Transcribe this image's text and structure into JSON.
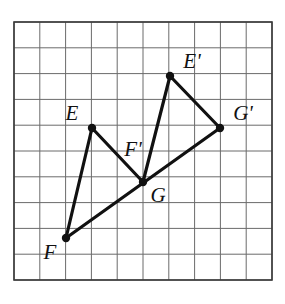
{
  "figure": {
    "background_color": "#ffffff",
    "grid": {
      "columns": 10,
      "rows": 10,
      "cell_size": 25.8,
      "origin_x": 14,
      "origin_y": 22,
      "line_color": "#6b6b6b",
      "border_color": "#3a3a3a",
      "line_width": 1,
      "border_width": 1.6
    },
    "shape_style": {
      "stroke_color": "#111111",
      "stroke_width": 3.2,
      "vertex_dot_color": "#111111",
      "vertex_dot_radius": 4.2
    },
    "label_font_size": 21
  },
  "points": [
    {
      "id": "E",
      "label": "E",
      "x": 92,
      "y": 128,
      "grid_col": 3,
      "grid_row": 4,
      "label_x": 72,
      "label_y": 120,
      "label_anchor": "middle"
    },
    {
      "id": "F",
      "label": "F",
      "x": 66,
      "y": 238,
      "grid_col": 2,
      "grid_row": 8.4,
      "label_x": 50,
      "label_y": 259,
      "label_anchor": "middle"
    },
    {
      "id": "G",
      "label": "G",
      "x": 143,
      "y": 182,
      "grid_col": 5,
      "grid_row": 6.2,
      "label_x": 158,
      "label_y": 202,
      "label_anchor": "middle"
    },
    {
      "id": "Ep",
      "label": "E'",
      "x": 170,
      "y": 76,
      "grid_col": 6,
      "grid_row": 2.1,
      "label_x": 192,
      "label_y": 68,
      "label_anchor": "middle"
    },
    {
      "id": "Fp",
      "label": "F'",
      "x": 143,
      "y": 182,
      "grid_col": 5,
      "grid_row": 6.2,
      "label_x": 133,
      "label_y": 156,
      "label_anchor": "middle"
    },
    {
      "id": "Gp",
      "label": "G'",
      "x": 220,
      "y": 128,
      "grid_col": 8,
      "grid_row": 4,
      "label_x": 243,
      "label_y": 120,
      "label_anchor": "middle"
    }
  ],
  "triangles": [
    {
      "name": "triangle-efg",
      "vertices": [
        "E",
        "F",
        "G"
      ],
      "label": "Triangle EFG"
    },
    {
      "name": "triangle-ep-fp-gp",
      "vertices": [
        "Ep",
        "Fp",
        "Gp"
      ],
      "label": "Triangle E'F'G'"
    }
  ],
  "segments": [
    {
      "name": "segment-e-f",
      "from": "E",
      "to": "F"
    },
    {
      "name": "segment-e-g",
      "from": "E",
      "to": "G"
    },
    {
      "name": "segment-f-gp",
      "from": "F",
      "to": "Gp"
    },
    {
      "name": "segment-ep-fp",
      "from": "Ep",
      "to": "Fp"
    },
    {
      "name": "segment-ep-gp",
      "from": "Ep",
      "to": "Gp"
    }
  ],
  "vertex_dots": [
    "E",
    "F",
    "G",
    "Ep",
    "Gp"
  ]
}
